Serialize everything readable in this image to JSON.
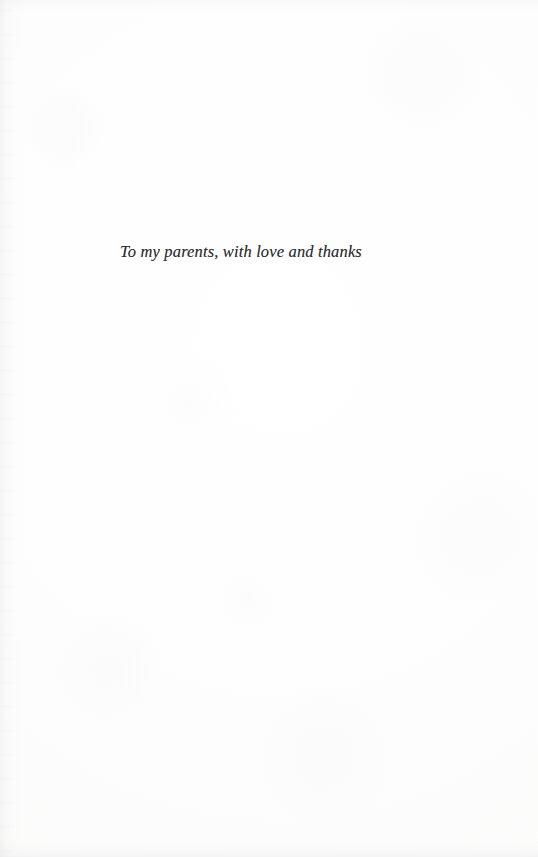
{
  "page": {
    "kind": "book-dedication-page",
    "background_color": "#fdfdfc",
    "ink_color": "#2b2b2d"
  },
  "dedication": {
    "text": "To my parents, with love and thanks"
  }
}
